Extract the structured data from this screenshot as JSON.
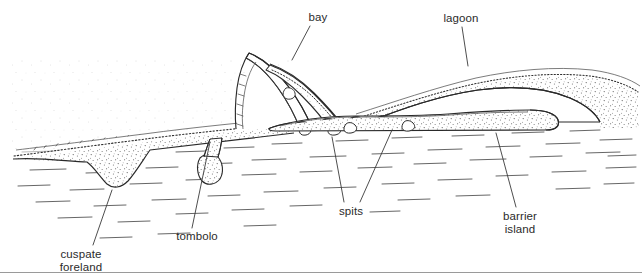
{
  "figure": {
    "type": "line-diagram",
    "width": 642,
    "height": 280,
    "background_color": "#ffffff",
    "ink_color": "#3a3a3a",
    "text_color": "#2b2b2b",
    "footer_rule_color": "#9a9a9a",
    "footer_rule_y": 272
  },
  "labels": {
    "bay": {
      "text": "bay",
      "x": 318,
      "y": 12
    },
    "lagoon": {
      "text": "lagoon",
      "x": 461,
      "y": 13
    },
    "spits": {
      "text": "spits",
      "x": 351,
      "y": 206
    },
    "cuspate_foreland": {
      "line1": "cuspate",
      "line2": "foreland",
      "x": 81,
      "y": 249
    },
    "tombolo": {
      "text": "tombolo",
      "x": 197,
      "y": 231
    },
    "barrier_island": {
      "line1": "barrier",
      "line2": "island",
      "x": 520,
      "y": 211
    }
  },
  "features": [
    {
      "name": "cuspate-foreland",
      "kind": "landform",
      "label": "cuspate foreland"
    },
    {
      "name": "tombolo",
      "kind": "landform",
      "label": "tombolo"
    },
    {
      "name": "spit-west",
      "kind": "landform",
      "label": "spits"
    },
    {
      "name": "spit-east",
      "kind": "landform",
      "label": "spits"
    },
    {
      "name": "bay",
      "kind": "water-body",
      "label": "bay"
    },
    {
      "name": "lagoon",
      "kind": "water-body",
      "label": "lagoon"
    },
    {
      "name": "barrier-island",
      "kind": "landform",
      "label": "barrier island"
    },
    {
      "name": "sea",
      "kind": "water-body",
      "label": "sea"
    },
    {
      "name": "mainland",
      "kind": "land",
      "label": "mainland"
    }
  ]
}
